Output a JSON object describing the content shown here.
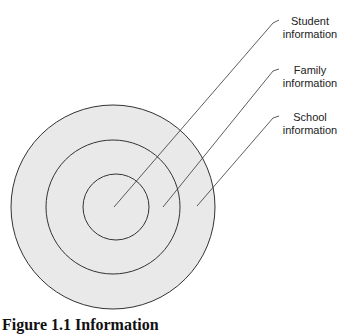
{
  "diagram": {
    "type": "concentric-circles",
    "colors": {
      "fill": "#e9e9e9",
      "stroke": "#333333",
      "background": "#ffffff"
    },
    "rings": [
      {
        "id": "outer",
        "label": "School information"
      },
      {
        "id": "middle",
        "label": "Family information"
      },
      {
        "id": "inner",
        "label": "Student information"
      }
    ],
    "labels": {
      "student": {
        "line1": "Student",
        "line2": "information"
      },
      "family": {
        "line1": "Family",
        "line2": "information"
      },
      "school": {
        "line1": "School",
        "line2": "information"
      }
    },
    "caption": "Figure 1.1 Information"
  }
}
